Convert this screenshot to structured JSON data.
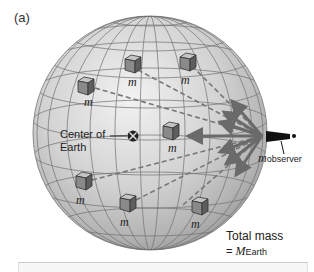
{
  "figure": {
    "panel_label": "(a)",
    "center_label_line1": "Center of",
    "center_label_line2": "Earth",
    "mass_label": "m",
    "observer_label_main": "m",
    "observer_label_sub": "observer",
    "total_mass_line1": "Total mass",
    "total_mass_eq": "=",
    "total_mass_symbol": "M",
    "total_mass_sub": "Earth"
  },
  "colors": {
    "sphere_light": "#e6e6e6",
    "sphere_dark": "#9a9a9a",
    "grid_line": "#6e6e6e",
    "arrow": "#6a6a6a",
    "dashed_line": "#777777",
    "cube_top": "#bdbdbd",
    "cube_front": "#8a8a8a",
    "cube_side": "#5e5e5e"
  },
  "masses": [
    {
      "x": 130,
      "y": 67
    },
    {
      "x": 87,
      "y": 85
    },
    {
      "x": 185,
      "y": 63
    },
    {
      "x": 173,
      "y": 131
    },
    {
      "x": 84,
      "y": 180
    },
    {
      "x": 128,
      "y": 202
    },
    {
      "x": 175,
      "y": 207
    }
  ]
}
